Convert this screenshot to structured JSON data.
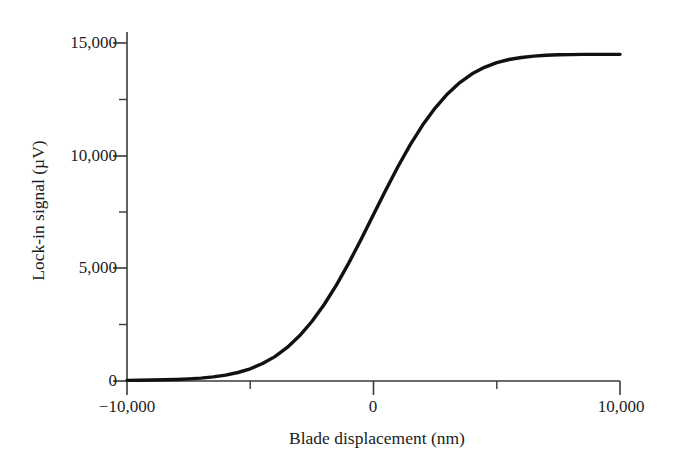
{
  "figure": {
    "background": "#ffffff",
    "line_color": "#111111",
    "axis_color": "#3a3a3a"
  },
  "axes": {
    "y_title": "Lock-in signal (µV)",
    "x_title": "Blade displacement (nm)",
    "y_ticks": [
      "15,000",
      "10,000",
      "5,000",
      "0"
    ],
    "x_ticks": [
      "−10,000",
      "0",
      "10,000"
    ]
  },
  "chart_data": {
    "type": "line",
    "title": "",
    "xlabel": "Blade displacement (nm)",
    "ylabel": "Lock-in signal (µV)",
    "xlim": [
      -10000,
      10000
    ],
    "ylim": [
      0,
      15600
    ],
    "grid": false,
    "legend": null,
    "x_major_ticks": [
      -10000,
      0,
      10000
    ],
    "x_minor_ticks": [
      -5000,
      5000
    ],
    "y_major_ticks": [
      0,
      5000,
      10000,
      15000
    ],
    "y_minor_ticks": [
      2500,
      7500,
      12500
    ],
    "x_tick_labels": [
      "−10,000",
      "0",
      "10,000"
    ],
    "y_tick_labels": [
      "0",
      "5,000",
      "10,000",
      "15,000"
    ],
    "series": [
      {
        "name": "Lock-in signal",
        "color": "#111111",
        "line_width": 3.4,
        "x": [
          -10000,
          -9500,
          -9000,
          -8500,
          -8000,
          -7500,
          -7000,
          -6500,
          -6000,
          -5500,
          -5000,
          -4500,
          -4000,
          -3500,
          -3000,
          -2500,
          -2000,
          -1500,
          -1000,
          -500,
          0,
          500,
          1000,
          1500,
          2000,
          2500,
          3000,
          3500,
          4000,
          4500,
          5000,
          5500,
          6000,
          6500,
          7000,
          7500,
          8000,
          8500,
          9000,
          9500,
          10000
        ],
        "y": [
          30,
          35,
          45,
          55,
          70,
          95,
          130,
          185,
          265,
          380,
          545,
          780,
          1090,
          1500,
          2020,
          2660,
          3420,
          4300,
          5280,
          6340,
          7440,
          8540,
          9600,
          10580,
          11450,
          12200,
          12830,
          13340,
          13730,
          14020,
          14230,
          14370,
          14460,
          14520,
          14560,
          14580,
          14590,
          14600,
          14600,
          14600,
          14600
        ]
      }
    ]
  }
}
